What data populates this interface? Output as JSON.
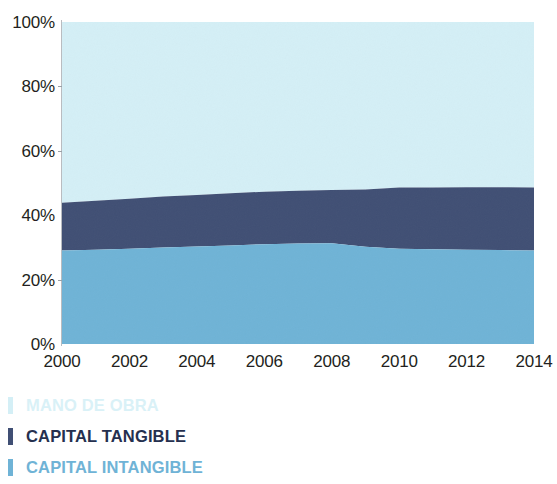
{
  "chart_data": {
    "type": "area",
    "title": "",
    "subtitle": "",
    "xlabel": "",
    "ylabel": "",
    "stacked": true,
    "normalized_100pct": true,
    "grid": false,
    "legend_position": "below",
    "xlim": [
      2000,
      2014
    ],
    "ylim": [
      0,
      100
    ],
    "x_tick_labels": [
      "2000",
      "2002",
      "2004",
      "2006",
      "2008",
      "2010",
      "2012",
      "2014"
    ],
    "x_tick_values": [
      2000,
      2002,
      2004,
      2006,
      2008,
      2010,
      2012,
      2014
    ],
    "y_tick_labels": [
      "0%",
      "20%",
      "40%",
      "60%",
      "80%",
      "100%"
    ],
    "y_tick_values": [
      0,
      20,
      40,
      60,
      80,
      100
    ],
    "x": [
      2000,
      2001,
      2002,
      2003,
      2004,
      2005,
      2006,
      2007,
      2008,
      2009,
      2010,
      2011,
      2012,
      2013,
      2014
    ],
    "series": [
      {
        "name": "CAPITAL INTANGIBLE",
        "color": "#6fb3d6",
        "stack_order": 1,
        "values": [
          29.0,
          29.3,
          29.6,
          30.0,
          30.3,
          30.6,
          31.0,
          31.2,
          31.3,
          30.2,
          29.6,
          29.4,
          29.3,
          29.2,
          29.0
        ]
      },
      {
        "name": "CAPITAL TANGIBLE",
        "color": "#404f74",
        "stack_order": 2,
        "values": [
          14.9,
          15.2,
          15.5,
          15.8,
          16.0,
          16.2,
          16.3,
          16.4,
          16.5,
          17.8,
          19.0,
          19.2,
          19.4,
          19.5,
          19.6
        ]
      },
      {
        "name": "MANO DE OBRA",
        "color": "#d4eff6",
        "stack_order": 3,
        "values": [
          56.1,
          55.5,
          54.9,
          54.2,
          53.7,
          53.2,
          52.7,
          52.4,
          52.2,
          52.0,
          51.4,
          51.4,
          51.3,
          51.3,
          51.4
        ]
      }
    ],
    "cumulative_upper_bounds": {
      "CAPITAL INTANGIBLE": [
        29.0,
        29.3,
        29.6,
        30.0,
        30.3,
        30.6,
        31.0,
        31.2,
        31.3,
        30.2,
        29.6,
        29.4,
        29.3,
        29.2,
        29.0
      ],
      "CAPITAL TANGIBLE": [
        43.9,
        44.5,
        45.1,
        45.8,
        46.3,
        46.8,
        47.3,
        47.6,
        47.8,
        48.0,
        48.6,
        48.6,
        48.7,
        48.7,
        48.6
      ]
    }
  },
  "axes": {
    "y_ticks": [
      {
        "label": "100%",
        "value": 100
      },
      {
        "label": "80%",
        "value": 80
      },
      {
        "label": "60%",
        "value": 60
      },
      {
        "label": "40%",
        "value": 40
      },
      {
        "label": "20%",
        "value": 20
      },
      {
        "label": "0%",
        "value": 0
      }
    ],
    "x_ticks": [
      {
        "label": "2000",
        "value": 2000
      },
      {
        "label": "2002",
        "value": 2002
      },
      {
        "label": "2004",
        "value": 2004
      },
      {
        "label": "2006",
        "value": 2006
      },
      {
        "label": "2008",
        "value": 2008
      },
      {
        "label": "2010",
        "value": 2010
      },
      {
        "label": "2012",
        "value": 2012
      },
      {
        "label": "2014",
        "value": 2014
      }
    ]
  },
  "legend": {
    "items": [
      {
        "label": "MANO DE OBRA",
        "color": "#d4eff6",
        "text_color": "#d9f1f7"
      },
      {
        "label": "CAPITAL TANGIBLE",
        "color": "#404f74",
        "text_color": "#25304f"
      },
      {
        "label": "CAPITAL INTANGIBLE",
        "color": "#6fb3d6",
        "text_color": "#6fb3d6"
      }
    ]
  },
  "colors": {
    "mano_de_obra": "#d4eff6",
    "capital_tangible": "#404f74",
    "capital_intangible": "#6fb3d6",
    "axis": "#b9bcc0",
    "tick_text": "#231f20",
    "background": "#ffffff"
  }
}
